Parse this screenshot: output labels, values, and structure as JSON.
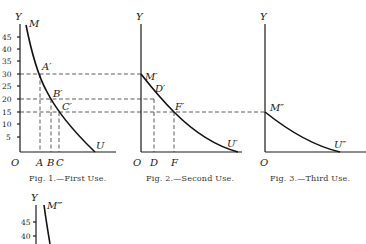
{
  "figures": [
    {
      "id": "fig1",
      "caption": "Fig. 1.—First Use.",
      "y_axis_label": "Y",
      "origin_label": "O",
      "y_ticks": [
        "45",
        "40",
        "35",
        "30",
        "25",
        "20",
        "15",
        "10",
        "5"
      ],
      "curve_start_label": "M",
      "curve_end_label": "U",
      "points": [
        "A′",
        "B′",
        "C′"
      ],
      "x_marks": [
        "A",
        "B",
        "C"
      ]
    },
    {
      "id": "fig2",
      "caption": "Fig. 2.—Second Use.",
      "y_axis_label": "Y",
      "origin_label": "O",
      "curve_start_label": "M′",
      "curve_end_label": "U′",
      "points": [
        "D′",
        "F′"
      ],
      "x_marks": [
        "D",
        "F"
      ]
    },
    {
      "id": "fig3",
      "caption": "Fig. 3.—Third Use.",
      "y_axis_label": "Y",
      "origin_label": "O",
      "curve_start_label": "M″",
      "curve_end_label": "U″"
    },
    {
      "id": "fig4",
      "y_axis_label": "Y",
      "curve_start_label": "M‴",
      "y_ticks": [
        "45",
        "40"
      ]
    }
  ]
}
